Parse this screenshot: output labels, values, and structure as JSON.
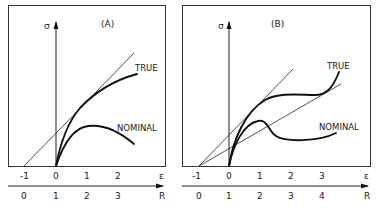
{
  "panels": [
    {
      "id": "A",
      "title": "(A)",
      "y_axis_label": "σ",
      "x_axis_label": "ε",
      "r_axis_label": "R",
      "epsilon_ticks": [
        "-1",
        "0",
        "1",
        "2"
      ],
      "r_ticks": [
        "0",
        "1",
        "2",
        "3"
      ],
      "curves": {
        "true_label": "TRUE",
        "nominal_label": "NOMINAL"
      },
      "tangent_lines": 1
    },
    {
      "id": "B",
      "title": "(B)",
      "y_axis_label": "σ",
      "x_axis_label": "ε",
      "r_axis_label": "R",
      "epsilon_ticks": [
        "-1",
        "0",
        "1",
        "2",
        "3"
      ],
      "r_ticks": [
        "0",
        "1",
        "2",
        "3",
        "4"
      ],
      "curves": {
        "true_label": "TRUE",
        "nominal_label": "NOMINAL"
      },
      "tangent_lines": 2
    }
  ]
}
